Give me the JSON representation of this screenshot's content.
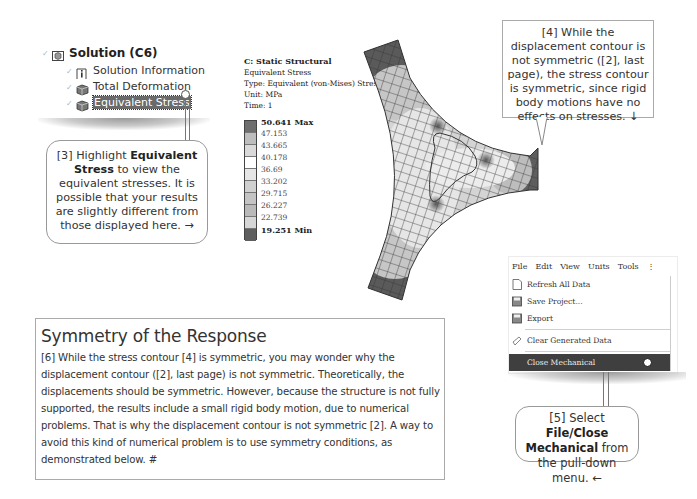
{
  "tree": {
    "items": [
      {
        "label": "Solution (C6)",
        "icon": "solution-icon",
        "bold": true
      },
      {
        "label": "Solution Information",
        "icon": "info-icon"
      },
      {
        "label": "Total Deformation",
        "icon": "result-cube-icon"
      },
      {
        "label": "Equivalent Stress",
        "icon": "result-cube-icon",
        "selected": true
      }
    ]
  },
  "callout3": {
    "prefix": "[3] Highlight ",
    "bold": "Equivalent Stress",
    "suffix": " to view the equivalent stresses.  It is possible that your results are slightly different from those displayed here.  →"
  },
  "legend": {
    "title": "C: Static Structural",
    "result": "Equivalent Stress",
    "type": "Type: Equivalent (von-Mises) Stress",
    "unit": "Unit: MPa",
    "time": "Time: 1",
    "values": [
      "50.641 Max",
      "47.153",
      "43.665",
      "40.178",
      "36.69",
      "33.202",
      "29.715",
      "26.227",
      "22.739",
      "19.251 Min"
    ],
    "colors": [
      "#6e6e6e",
      "#bdbdbd",
      "#d9d9d9",
      "#ffffff",
      "#e6e6e6",
      "#d0d0d0",
      "#c4c4c4",
      "#b9b9b9",
      "#d6d6d6",
      "#5e5e5e"
    ]
  },
  "callout4": {
    "text": "[4] While the displacement contour is not symmetric ([2], last page), the stress contour is symmetric, since rigid body motions have no effects on stresses.  ↓"
  },
  "menu": {
    "bar": [
      "File",
      "Edit",
      "View",
      "Units",
      "Tools",
      "⋮"
    ],
    "items": [
      {
        "label": "Refresh All Data",
        "icon": "refresh-icon"
      },
      {
        "label": "Save Project...",
        "icon": "save-icon"
      },
      {
        "label": "Export",
        "icon": "export-icon"
      },
      {
        "label": "Clear Generated Data",
        "icon": "clear-icon"
      },
      {
        "label": "Close Mechanical",
        "highlighted": true
      }
    ]
  },
  "callout5": {
    "prefix": "[5] Select ",
    "bold": "File/Close Mechanical",
    "suffix": " from the pull-down menu.  ←"
  },
  "symmetry": {
    "title": "Symmetry of the Response",
    "body": "[6] While the stress contour [4] is symmetric, you may wonder why the displacement contour ([2], last page) is not symmetric.  Theoretically, the displacements should be symmetric.  However, because the structure is not fully supported, the results include a small rigid body motion, due to numerical problems.  That is why the displacement contour is not symmetric [2].  A way to avoid this kind of numerical problem is to use symmetry conditions, as demonstrated below.  #"
  }
}
